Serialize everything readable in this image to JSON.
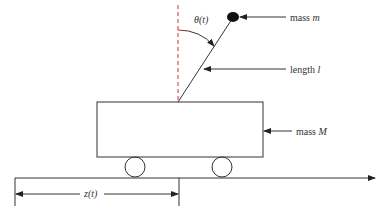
{
  "diagram": {
    "labels": {
      "theta": "θ(t)",
      "mass_m_prefix": "mass ",
      "mass_m_var": "m",
      "length_prefix": "length ",
      "length_var": "l",
      "mass_M_prefix": "mass ",
      "mass_M_var": "M",
      "position": "z(t)"
    },
    "colors": {
      "stroke": "#333333",
      "angle_arc_start": "#cc2222",
      "mass_fill": "#111111"
    }
  }
}
